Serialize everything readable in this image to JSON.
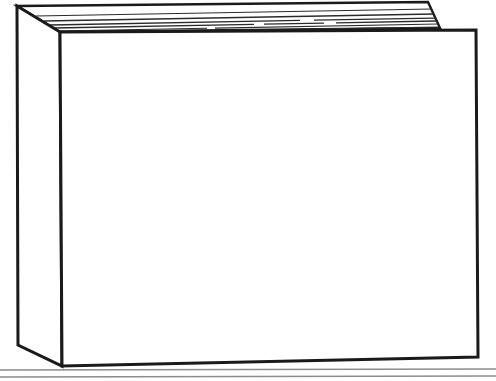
{
  "image": {
    "width": 496,
    "height": 381,
    "background_color": "#ffffff",
    "style": "black-and-white line art / ink drawing",
    "subject": "closed hardcover book standing upright in three-quarter perspective",
    "title": "Book line drawing",
    "alt_text": "A line drawing of a closed hardcover book seen from the front-left, resting on a flat surface. The narrow spine faces left, the large blank front cover faces the viewer, and several thin lines along the top show the stacked page edges and the back cover projecting behind.",
    "visible_text": "",
    "colors": {
      "outline": "#1a1a1a",
      "fill": "#ffffff",
      "page_edge_line": "#2b2b2b",
      "surface_line": "#8c8c8c"
    }
  },
  "drawing": {
    "label": "book-illustration",
    "parts": [
      {
        "id": "front-cover",
        "name": "Front cover",
        "description": "Large blank quadrilateral facing the viewer",
        "fill": "#ffffff",
        "stroke": "#1a1a1a",
        "stroke_width": 3,
        "points": "60,32 476,30 478,357 62,366"
      },
      {
        "id": "spine",
        "name": "Spine",
        "description": "Narrow left-facing side of the book",
        "fill": "#ffffff",
        "stroke": "#1a1a1a",
        "stroke_width": 3,
        "points": "17,6 60,32 62,366 18,345"
      },
      {
        "id": "back-cover-flap",
        "name": "Back cover top edge",
        "description": "Upper board of the book projecting behind and above the pages",
        "fill": "#ffffff",
        "stroke": "#1a1a1a",
        "stroke_width": 2.4,
        "points": "17,6 428,2 440,28 60,32"
      }
    ],
    "page_edges": {
      "name": "Stacked page edges",
      "description": "Thin nearly-horizontal lines along the top of the book representing individual sheets",
      "stroke": "#2b2b2b",
      "count": 6,
      "lines": [
        {
          "x1": 36,
          "y1": 16,
          "x2": 432,
          "y2": 9,
          "width": 1.2,
          "dash": ""
        },
        {
          "x1": 44,
          "y1": 21,
          "x2": 434,
          "y2": 14,
          "width": 1.4,
          "dash": ""
        },
        {
          "x1": 50,
          "y1": 25,
          "x2": 436,
          "y2": 18,
          "width": 1.3,
          "dash": "250 14 120 0"
        },
        {
          "x1": 54,
          "y1": 28,
          "x2": 437,
          "y2": 21,
          "width": 1.3,
          "dash": "200 10 60 12 100 0"
        },
        {
          "x1": 57,
          "y1": 31,
          "x2": 438,
          "y2": 24,
          "width": 1.1,
          "dash": "150 8 210 0"
        },
        {
          "x1": 59,
          "y1": 33,
          "x2": 439,
          "y2": 27,
          "width": 1.0,
          "dash": "96 10 280 0"
        }
      ]
    },
    "surface": {
      "name": "Table or shelf surface",
      "description": "Two thin horizontal rules running the full width below the book",
      "stroke": "#8c8c8c",
      "lines": [
        {
          "x1": 0,
          "y1": 370,
          "x2": 496,
          "y2": 369,
          "width": 1.4
        },
        {
          "x1": 0,
          "y1": 377,
          "x2": 496,
          "y2": 376,
          "width": 1.4
        }
      ]
    }
  }
}
